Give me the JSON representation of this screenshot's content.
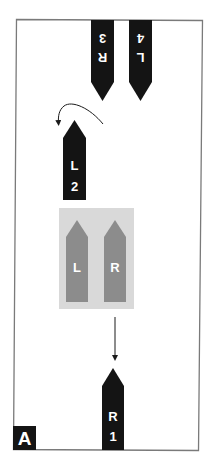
{
  "figure": {
    "panel_label": "A",
    "colors": {
      "frame": "#7a7a7a",
      "dark_arrow": "#141414",
      "light_arrow": "#8c8c8c",
      "zone_fill": "#d9d9d9",
      "label_text": "#ffffff",
      "badge_fill": "#141414"
    },
    "arrows": [
      {
        "id": "R3",
        "side": "R",
        "number": "3",
        "direction": "down",
        "style": "dark"
      },
      {
        "id": "L4",
        "side": "L",
        "number": "4",
        "direction": "down",
        "style": "dark"
      },
      {
        "id": "L2",
        "side": "L",
        "number": "2",
        "direction": "up",
        "style": "dark"
      },
      {
        "id": "R1",
        "side": "R",
        "number": "1",
        "direction": "up",
        "style": "dark"
      }
    ],
    "zone": {
      "arrows": [
        {
          "side": "L",
          "direction": "up",
          "style": "light"
        },
        {
          "side": "R",
          "direction": "up",
          "style": "light"
        }
      ]
    },
    "connectors": [
      {
        "from": "R3",
        "to": "L2",
        "type": "curved-arrow"
      },
      {
        "from": "zone",
        "to": "R1",
        "type": "straight-arrow"
      }
    ]
  }
}
